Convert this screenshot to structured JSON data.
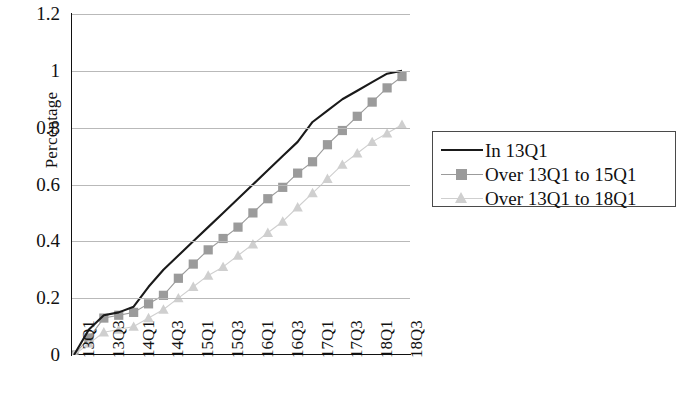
{
  "chart_data": {
    "type": "line",
    "title": "",
    "subtitle": "",
    "xlabel": "",
    "ylabel": "Percentage",
    "ylim": [
      0,
      1.2
    ],
    "yticks": [
      0,
      0.2,
      0.4,
      0.6,
      0.8,
      1,
      1.2
    ],
    "ytick_labels": [
      "0",
      "0.2",
      "0.4",
      "0.6",
      "0.8",
      "1",
      "1.2"
    ],
    "grid": "horizontal",
    "legend_position": "right",
    "x": [
      "13Q1",
      "13Q2",
      "13Q3",
      "13Q4",
      "14Q1",
      "14Q2",
      "14Q3",
      "14Q4",
      "15Q1",
      "15Q2",
      "15Q3",
      "15Q4",
      "16Q1",
      "16Q2",
      "16Q3",
      "16Q4",
      "17Q1",
      "17Q2",
      "17Q3",
      "17Q4",
      "18Q1",
      "18Q2",
      "18Q3"
    ],
    "xtick_labels": [
      "13Q1",
      "13Q3",
      "14Q1",
      "14Q3",
      "15Q1",
      "15Q3",
      "16Q1",
      "16Q3",
      "17Q1",
      "17Q3",
      "18Q1",
      "18Q3"
    ],
    "xtick_indices": [
      0,
      2,
      4,
      6,
      8,
      10,
      12,
      14,
      16,
      18,
      20,
      22
    ],
    "series": [
      {
        "name": "In 13Q1",
        "marker": "none",
        "color": "#1a1a1a",
        "values": [
          0.0,
          0.09,
          0.14,
          0.15,
          0.17,
          0.24,
          0.3,
          0.35,
          0.4,
          0.45,
          0.5,
          0.55,
          0.6,
          0.65,
          0.7,
          0.75,
          0.82,
          0.86,
          0.9,
          0.93,
          0.96,
          0.99,
          1.0
        ]
      },
      {
        "name": "Over 13Q1 to 15Q1",
        "marker": "square",
        "color": "#9b9b9b",
        "values": [
          0.0,
          0.06,
          0.13,
          0.14,
          0.15,
          0.18,
          0.21,
          0.27,
          0.32,
          0.37,
          0.41,
          0.45,
          0.5,
          0.55,
          0.59,
          0.64,
          0.68,
          0.74,
          0.79,
          0.84,
          0.89,
          0.94,
          0.98
        ]
      },
      {
        "name": "Over 13Q1 to 18Q1",
        "marker": "triangle",
        "color": "#cfcfcf",
        "values": [
          0.0,
          0.04,
          0.08,
          0.09,
          0.1,
          0.13,
          0.16,
          0.2,
          0.24,
          0.28,
          0.31,
          0.35,
          0.39,
          0.43,
          0.47,
          0.52,
          0.57,
          0.62,
          0.67,
          0.71,
          0.75,
          0.78,
          0.81
        ]
      }
    ]
  },
  "axis": {
    "y_title": "Percentage"
  }
}
